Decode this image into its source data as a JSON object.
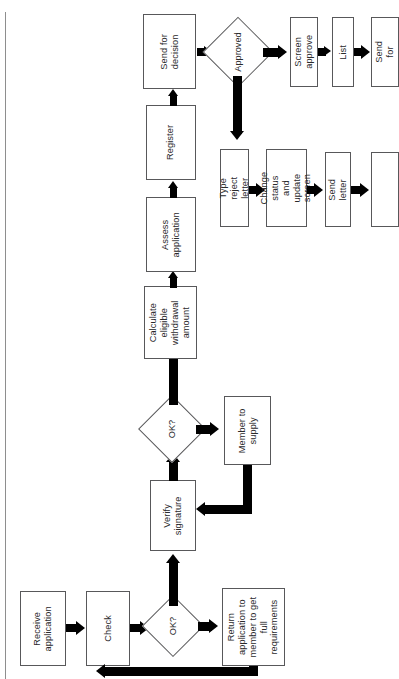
{
  "diagram": {
    "orientation": "rotated-90-ccw",
    "colors": {
      "ink": "#000000",
      "outline": "#58585a",
      "paper": "#ffffff",
      "scan_edge": "#8e8e8e"
    },
    "nodes": [
      {
        "id": "receive-application",
        "type": "process",
        "label": "Receive\napplication"
      },
      {
        "id": "check",
        "type": "process",
        "label": "Check"
      },
      {
        "id": "ok-1",
        "type": "decision",
        "label": "OK?"
      },
      {
        "id": "return-application",
        "type": "process",
        "label": "Return\napplication to\nmember to get\nfull\nrequirements"
      },
      {
        "id": "verify-signature",
        "type": "process",
        "label": "Verify\nsignature"
      },
      {
        "id": "ok-2",
        "type": "decision",
        "label": "OK?"
      },
      {
        "id": "member-to-supply",
        "type": "process",
        "label": "Member to\nsupply"
      },
      {
        "id": "calculate-eligible-withdrawal-amount",
        "type": "process",
        "label": "Calculate\neligible\nwithdrawal\namount"
      },
      {
        "id": "assess-application",
        "type": "process",
        "label": "Assess\napplication"
      },
      {
        "id": "register",
        "type": "process",
        "label": "Register"
      },
      {
        "id": "send-for-decision",
        "type": "process",
        "label": "Send for\ndecision"
      },
      {
        "id": "approved",
        "type": "decision",
        "label": "Approved"
      },
      {
        "id": "screen-approve",
        "type": "process",
        "label": "Screen\napprove"
      },
      {
        "id": "list",
        "type": "process",
        "label": "List"
      },
      {
        "id": "send-for",
        "type": "process",
        "label": "Send for"
      },
      {
        "id": "type-reject-letter",
        "type": "process",
        "label": "Type reject\nletter"
      },
      {
        "id": "change-status-and-update-screen",
        "type": "process",
        "label": "Change status\nand update\nscreen"
      },
      {
        "id": "send-letter",
        "type": "process",
        "label": "Send letter"
      },
      {
        "id": "reject-tail",
        "type": "process",
        "label": ""
      }
    ]
  }
}
